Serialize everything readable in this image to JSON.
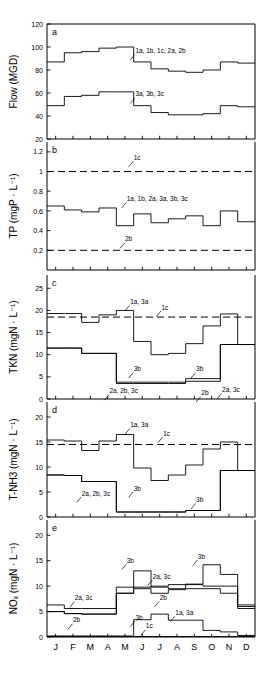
{
  "figure": {
    "months": [
      "J",
      "F",
      "M",
      "A",
      "M",
      "J",
      "J",
      "A",
      "S",
      "O",
      "N",
      "D"
    ],
    "panel_letters": [
      "a",
      "b",
      "c",
      "d",
      "e"
    ]
  },
  "chart_data": [
    {
      "type": "line",
      "panel": "a",
      "title": "a",
      "ylabel": "Flow (MGD)",
      "xlabel": "",
      "ylim": [
        20,
        120
      ],
      "yticks": [
        20,
        40,
        60,
        80,
        100,
        120
      ],
      "categories": [
        "J",
        "F",
        "M",
        "A",
        "M",
        "J",
        "J",
        "A",
        "S",
        "O",
        "N",
        "D"
      ],
      "grid": false,
      "legend": "inline-annotations",
      "series": [
        {
          "name": "1a, 1b, 1c, 2a, 2b",
          "style": "step",
          "values": [
            87,
            95,
            96,
            99,
            100,
            87,
            81,
            79,
            78,
            80,
            87,
            86
          ]
        },
        {
          "name": "3a, 3b, 3c",
          "style": "step",
          "values": [
            49,
            57,
            58,
            61,
            61,
            49,
            43,
            41,
            41,
            42,
            49,
            48
          ]
        }
      ],
      "annotations": [
        {
          "label": "1a, 1b, 1c, 2a, 2b",
          "x": 5.1,
          "y": 95
        },
        {
          "label": "3a, 3b, 3c",
          "x": 5.1,
          "y": 57
        }
      ]
    },
    {
      "type": "line",
      "panel": "b",
      "title": "b",
      "ylabel": "TP (mgP · L⁻¹)",
      "xlabel": "",
      "ylim": [
        0,
        1.3
      ],
      "yticks": [
        0.2,
        0.4,
        0.6,
        0.8,
        1.0,
        1.2
      ],
      "categories": [
        "J",
        "F",
        "M",
        "A",
        "M",
        "J",
        "J",
        "A",
        "S",
        "O",
        "N",
        "D"
      ],
      "grid": false,
      "series": [
        {
          "name": "1a, 1b, 2a, 3a, 3b, 3c",
          "style": "step",
          "values": [
            0.65,
            0.61,
            0.59,
            0.63,
            0.45,
            0.57,
            0.48,
            0.52,
            0.55,
            0.45,
            0.6,
            0.49
          ]
        },
        {
          "name": "1c",
          "style": "dashed-constant",
          "values": [
            1.0,
            1.0,
            1.0,
            1.0,
            1.0,
            1.0,
            1.0,
            1.0,
            1.0,
            1.0,
            1.0,
            1.0
          ]
        },
        {
          "name": "2b",
          "style": "dashed-constant",
          "values": [
            0.2,
            0.2,
            0.2,
            0.2,
            0.2,
            0.2,
            0.2,
            0.2,
            0.2,
            0.2,
            0.2,
            0.2
          ]
        }
      ],
      "annotations": [
        {
          "label": "1c",
          "x": 5.0,
          "y": 1.12
        },
        {
          "label": "1a, 1b, 2a, 3a, 3b, 3c",
          "x": 4.6,
          "y": 0.7
        },
        {
          "label": "2b",
          "x": 4.5,
          "y": 0.29
        }
      ]
    },
    {
      "type": "line",
      "panel": "c",
      "title": "c",
      "ylabel": "TKN (mgN · L⁻¹)",
      "xlabel": "",
      "ylim": [
        0,
        28
      ],
      "yticks": [
        0,
        5,
        10,
        15,
        20,
        25
      ],
      "categories": [
        "J",
        "F",
        "M",
        "A",
        "M",
        "J",
        "J",
        "A",
        "S",
        "O",
        "N",
        "D"
      ],
      "grid": false,
      "series": [
        {
          "name": "1a, 3a",
          "style": "step",
          "values": [
            19.3,
            19.3,
            17.3,
            19.0,
            20.0,
            13.0,
            10.0,
            10.3,
            12.5,
            16.5,
            19.2,
            12.3
          ]
        },
        {
          "name": "1c",
          "style": "dashed-constant",
          "values": [
            18.5,
            18.5,
            18.5,
            18.5,
            18.5,
            18.5,
            18.5,
            18.5,
            18.5,
            18.5,
            18.5,
            18.5
          ]
        },
        {
          "name": "3b",
          "style": "step",
          "values": [
            11.5,
            11.5,
            10.3,
            10.3,
            3.8,
            3.8,
            3.8,
            3.8,
            4.6,
            4.6,
            12.3,
            12.3
          ]
        },
        {
          "name": "2a, 2b, 3c",
          "style": "step",
          "values": [
            11.5,
            11.5,
            10.3,
            10.3,
            3.5,
            3.5,
            3.5,
            3.5,
            4.0,
            4.0,
            12.3,
            12.3
          ]
        }
      ],
      "annotations": [
        {
          "label": "1a, 3a",
          "x": 4.8,
          "y": 21.5
        },
        {
          "label": "1c",
          "x": 6.6,
          "y": 20.2
        },
        {
          "label": "3b",
          "x": 5.0,
          "y": 6.3
        },
        {
          "label": "3b",
          "x": 8.6,
          "y": 6.3
        },
        {
          "label": "2a, 2b, 3c",
          "x": 3.6,
          "y": 1.3
        },
        {
          "label": "2b",
          "x": 8.9,
          "y": 0.9
        },
        {
          "label": "2a, 3c",
          "x": 10.1,
          "y": 1.6
        }
      ]
    },
    {
      "type": "line",
      "panel": "d",
      "title": "d",
      "ylabel": "T-NH3 (mgN · L⁻¹)",
      "xlabel": "",
      "ylim": [
        0,
        23
      ],
      "yticks": [
        0,
        5,
        10,
        15,
        20
      ],
      "categories": [
        "J",
        "F",
        "M",
        "A",
        "M",
        "J",
        "J",
        "A",
        "S",
        "O",
        "N",
        "D"
      ],
      "grid": false,
      "series": [
        {
          "name": "1a, 3a",
          "style": "step",
          "values": [
            15.4,
            15.2,
            13.3,
            15.2,
            16.5,
            9.8,
            7.3,
            8.4,
            10.4,
            13.6,
            15.0,
            9.3
          ]
        },
        {
          "name": "1c",
          "style": "dashed-constant",
          "values": [
            14.5,
            14.5,
            14.5,
            14.5,
            14.5,
            14.5,
            14.5,
            14.5,
            14.5,
            14.5,
            14.5,
            14.5
          ]
        },
        {
          "name": "2a, 2b, 3c",
          "style": "step",
          "values": [
            8.4,
            8.3,
            7.1,
            7.1,
            1.0,
            1.0,
            1.0,
            1.0,
            1.3,
            1.3,
            9.3,
            9.3
          ]
        },
        {
          "name": "3b",
          "style": "step",
          "values": [
            8.4,
            8.3,
            7.1,
            7.1,
            1.0,
            1.0,
            1.0,
            1.0,
            1.3,
            1.3,
            9.3,
            9.3
          ]
        }
      ],
      "annotations": [
        {
          "label": "1a, 3a",
          "x": 4.8,
          "y": 18.0
        },
        {
          "label": "1c",
          "x": 6.7,
          "y": 16.3
        },
        {
          "label": "2a, 2b, 3c",
          "x": 2.0,
          "y": 4.3
        },
        {
          "label": "3b",
          "x": 5.0,
          "y": 5.3
        },
        {
          "label": "3b",
          "x": 8.6,
          "y": 3.0
        }
      ]
    },
    {
      "type": "line",
      "panel": "e",
      "title": "e",
      "ylabel": "NOₓ (mgN · L⁻¹)",
      "xlabel": "",
      "ylim": [
        0,
        23
      ],
      "yticks": [
        0,
        5,
        10,
        15,
        20
      ],
      "categories": [
        "J",
        "F",
        "M",
        "A",
        "M",
        "J",
        "J",
        "A",
        "S",
        "O",
        "N",
        "D"
      ],
      "grid": false,
      "series": [
        {
          "name": "3b",
          "style": "step",
          "values": [
            5.0,
            4.6,
            4.5,
            4.5,
            8.6,
            13.0,
            9.8,
            9.5,
            10.4,
            14.2,
            12.3,
            6.0
          ]
        },
        {
          "name": "2a, 3c",
          "style": "step",
          "values": [
            6.3,
            5.6,
            5.6,
            5.6,
            9.8,
            9.8,
            10.0,
            10.3,
            10.3,
            10.0,
            10.0,
            6.3
          ]
        },
        {
          "name": "2b",
          "style": "step",
          "values": [
            5.0,
            4.6,
            4.5,
            4.5,
            8.6,
            9.5,
            8.6,
            9.3,
            9.5,
            9.5,
            8.6,
            5.6
          ]
        },
        {
          "name": "1a, 3a",
          "style": "step",
          "values": [
            0.2,
            0.2,
            0.2,
            0.2,
            0.2,
            3.4,
            4.5,
            3.3,
            3.3,
            1.3,
            1.0,
            0.3
          ]
        },
        {
          "name": "1c",
          "style": "step",
          "values": [
            0.1,
            0.1,
            0.1,
            0.1,
            0.1,
            0.1,
            0.1,
            0.1,
            0.1,
            0.1,
            0.1,
            0.1
          ]
        }
      ],
      "annotations": [
        {
          "label": "3b",
          "x": 4.6,
          "y": 14.6
        },
        {
          "label": "3b",
          "x": 8.7,
          "y": 15.4
        },
        {
          "label": "2a, 3c",
          "x": 1.6,
          "y": 7.2
        },
        {
          "label": "2a, 3c",
          "x": 6.1,
          "y": 11.5
        },
        {
          "label": "2b",
          "x": 1.5,
          "y": 2.9
        },
        {
          "label": "2b",
          "x": 6.5,
          "y": 7.3
        },
        {
          "label": "3b",
          "x": 5.1,
          "y": 3.4
        },
        {
          "label": "1a, 3a",
          "x": 7.4,
          "y": 4.4
        },
        {
          "label": "1c",
          "x": 5.7,
          "y": 1.7
        }
      ]
    }
  ]
}
